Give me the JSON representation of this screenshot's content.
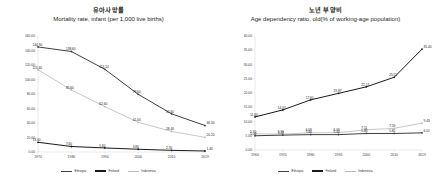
{
  "colors": {
    "ethiopia": "#3f3f3f",
    "finland": "#1a1a1a",
    "indonesia": "#b9b9b9",
    "axis": "#d4d4d4",
    "text": "#231f20"
  },
  "legend": {
    "items": [
      {
        "label": "Ethiopia",
        "color": "#3f3f3f"
      },
      {
        "label": "Finland",
        "color": "#1a1a1a"
      },
      {
        "label": "Indonesia",
        "color": "#b9b9b9"
      }
    ],
    "position": "bottom"
  },
  "left": {
    "title_ko": "유아사망률",
    "title_en": "Mortality rate, infant (per 1,000 live births)",
    "yticks": [
      "160.00",
      "140.00",
      "120.00",
      "100.00",
      "80.00",
      "60.00",
      "40.00",
      "20.00",
      "0.00"
    ],
    "xticks": [
      "1970",
      "1980",
      "1990",
      "2000",
      "2010",
      "2019"
    ]
  },
  "right": {
    "title_ko": "노년 부양비",
    "title_en": "Age dependency ratio, old(% of working-age population)",
    "yticks": [
      "40.00",
      "35.00",
      "30.00",
      "25.00",
      "20.00",
      "15.00",
      "10.00",
      "5.00",
      "0.00"
    ],
    "xticks": [
      "1960",
      "1970",
      "1980",
      "1990",
      "2000",
      "2010",
      "2019"
    ]
  },
  "chart_data": [
    {
      "type": "line",
      "title": "유아사망률 — Mortality rate, infant (per 1,000 live births)",
      "xlabel": "",
      "ylabel": "",
      "categories": [
        "1970",
        "1980",
        "1990",
        "2000",
        "2010",
        "2019"
      ],
      "ylim": [
        0,
        160
      ],
      "ytick_step": 20,
      "grid": false,
      "legend": "bottom",
      "series": [
        {
          "name": "Ethiopia",
          "color": "#3f3f3f",
          "values": [
            144.9,
            138.6,
            114.1,
            79.6,
            52.6,
            36.5
          ],
          "labels": [
            "144.90",
            "138.60",
            "114.10",
            "79.60",
            "52.60",
            "36.50"
          ]
        },
        {
          "name": "Indonesia",
          "color": "#b9b9b9",
          "values": [
            113.4,
            85.6,
            62.6,
            41.0,
            28.4,
            20.2
          ],
          "labels": [
            "113.40",
            "85.60",
            "62.60",
            "41.00",
            "28.40",
            "20.20"
          ]
        },
        {
          "name": "Finland",
          "color": "#1a1a1a",
          "values": [
            13.4,
            7.6,
            5.6,
            3.8,
            2.3,
            1.4
          ],
          "labels": [
            "13.40",
            "7.60",
            "5.60",
            "3.80",
            "2.30",
            "1.40"
          ]
        }
      ]
    },
    {
      "type": "line",
      "title": "노년 부양비 — Age dependency ratio, old(% of working-age population)",
      "xlabel": "",
      "ylabel": "",
      "categories": [
        "1960",
        "1970",
        "1980",
        "1990",
        "2000",
        "2010",
        "2019"
      ],
      "ylim": [
        0,
        40
      ],
      "ytick_step": 5,
      "grid": false,
      "legend": "bottom",
      "series": [
        {
          "name": "Finland",
          "color": "#1a1a1a",
          "values": [
            11.6,
            14.07,
            17.6,
            19.87,
            22.17,
            25.51,
            35.4
          ],
          "labels": [
            "11.60",
            "14.07",
            "17.60",
            "19.87",
            "22.17",
            "25.51",
            "35.40"
          ]
        },
        {
          "name": "Indonesia",
          "color": "#b9b9b9",
          "values": [
            5.7,
            5.55,
            6.09,
            6.09,
            7.11,
            7.59,
            9.43
          ],
          "labels": [
            "5.70",
            "5.55",
            "6.09",
            "6.09",
            "7.11",
            "7.59",
            "9.43"
          ]
        },
        {
          "name": "Ethiopia",
          "color": "#3f3f3f",
          "values": [
            5.0,
            5.22,
            5.4,
            5.4,
            5.8,
            5.8,
            6.01
          ],
          "labels": [
            "5.00",
            "5.22",
            "5.40",
            "5.40",
            "5.80",
            "5.80",
            "6.01"
          ]
        }
      ]
    }
  ]
}
